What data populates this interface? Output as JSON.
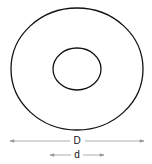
{
  "diagram": {
    "type": "annular washer / ring",
    "outer_diameter_label": "D",
    "inner_diameter_label": "d",
    "stroke_color": "#111111",
    "dimension_line_color": "#999999"
  }
}
